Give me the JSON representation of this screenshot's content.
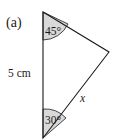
{
  "figure": {
    "part_label": "(a)",
    "side_label": "5 cm",
    "unknown_label": "x",
    "angles": {
      "top": "45°",
      "bottom": "30°"
    },
    "colors": {
      "stroke": "#1a1a1a",
      "angle_fill": "#d9d9d9",
      "background": "#ffffff"
    }
  }
}
